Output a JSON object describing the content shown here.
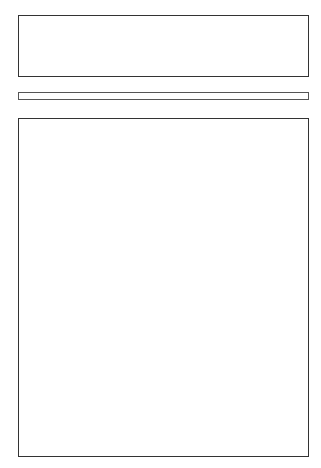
{
  "colors": {
    "frame": "#333333",
    "dark": "#8c8c8c",
    "mid": "#b0b0b0",
    "light": "#d4d4d4",
    "pale": "#e8e8e8",
    "white": "#ffffff"
  },
  "controls": {
    "up_arrow": "↑",
    "down_arrow": "↓"
  },
  "top_row": {
    "tiles": [
      {
        "band": "mid",
        "pattern": "grid",
        "cells": [
          "light",
          "pale",
          "pale",
          "light",
          "light",
          "pale"
        ]
      },
      {
        "band": "pale",
        "pattern": "f",
        "cells": [
          "white",
          "dark",
          "dark",
          "white",
          "white",
          "dark"
        ]
      },
      {
        "band": "mid",
        "pattern": "grid",
        "cells": [
          "pale",
          "pale",
          "pale",
          "pale",
          "pale",
          "pale"
        ]
      },
      {
        "band": "pale",
        "pattern": "f",
        "cells": [
          "dark",
          "white",
          "white",
          "dark",
          "dark",
          "white"
        ]
      },
      {
        "band": "mid",
        "pattern": "f",
        "cells": [
          "pale",
          "dark",
          "dark",
          "pale",
          "pale",
          "dark"
        ]
      }
    ]
  },
  "grid": {
    "rows": [
      {
        "tiles": [
          {
            "band": "pale",
            "pattern": "f",
            "cells": [
              "dark",
              "light",
              "light",
              "dark",
              "dark",
              "light"
            ]
          },
          {
            "band": "mid",
            "pattern": "grid",
            "cells": [
              "pale",
              "pale",
              "pale",
              "pale",
              "pale",
              "pale"
            ]
          },
          {
            "band": "pale",
            "pattern": "f",
            "cells": [
              "dark",
              "white",
              "white",
              "dark",
              "dark",
              "white"
            ]
          },
          {
            "band": "mid",
            "pattern": "f",
            "cells": [
              "pale",
              "mid",
              "mid",
              "pale",
              "pale",
              "mid"
            ]
          },
          {
            "band": "pale",
            "pattern": "grid",
            "cells": [
              "pale",
              "pale",
              "pale",
              "pale",
              "pale",
              "pale"
            ]
          }
        ]
      },
      {
        "tiles": [
          {
            "band": "light",
            "pattern": "grid",
            "cells": [
              "pale",
              "pale",
              "pale",
              "pale",
              "pale",
              "pale"
            ]
          },
          {
            "band": "light",
            "pattern": "grid",
            "cells": [
              "light",
              "mid",
              "mid",
              "light",
              "light",
              "mid"
            ]
          },
          {
            "band": "light",
            "pattern": "f",
            "cells": [
              "pale",
              "mid",
              "mid",
              "pale",
              "pale",
              "mid"
            ]
          },
          {
            "band": "pale",
            "pattern": "f",
            "cells": [
              "dark",
              "light",
              "light",
              "dark",
              "dark",
              "light"
            ]
          },
          {
            "band": "mid",
            "pattern": "f",
            "cells": [
              "mid",
              "pale",
              "pale",
              "mid",
              "mid",
              "pale"
            ]
          }
        ]
      },
      {
        "tiles": [
          {
            "band": "pale",
            "pattern": "f",
            "cells": [
              "pale",
              "mid",
              "mid",
              "white",
              "pale",
              "mid"
            ]
          },
          {
            "band": "pale",
            "pattern": "grid",
            "cells": [
              "mid",
              "mid",
              "light",
              "light",
              "mid",
              "mid"
            ]
          },
          {
            "band": "mid",
            "pattern": "f",
            "cells": [
              "dark",
              "white",
              "white",
              "dark",
              "dark",
              "white"
            ]
          },
          {
            "band": "pale",
            "pattern": "f",
            "cells": [
              "mid",
              "pale",
              "pale",
              "mid",
              "mid",
              "pale"
            ]
          },
          {
            "band": "light",
            "pattern": "f",
            "cells": [
              "white",
              "mid",
              "mid",
              "white",
              "white",
              "mid"
            ]
          }
        ]
      },
      {
        "tiles": [
          {
            "band": "mid",
            "pattern": "f",
            "cells": [
              "white",
              "mid",
              "mid",
              "white",
              "white",
              "mid"
            ]
          },
          {
            "band": "light",
            "pattern": "grid",
            "cells": [
              "pale",
              "pale",
              "pale",
              "pale",
              "pale",
              "pale"
            ]
          },
          {
            "band": "pale",
            "pattern": "f",
            "cells": [
              "dark",
              "light",
              "light",
              "dark",
              "dark",
              "light"
            ]
          },
          {
            "band": "mid",
            "pattern": "grid",
            "cells": [
              "pale",
              "pale",
              "pale",
              "pale",
              "pale",
              "pale"
            ]
          },
          {
            "band": "pale",
            "pattern": "f",
            "cells": [
              "mid",
              "white",
              "white",
              "mid",
              "mid",
              "white"
            ]
          }
        ]
      },
      {
        "tiles": [
          {
            "band": "pale",
            "pattern": "grid",
            "cells": [
              "light",
              "light",
              "light",
              "light",
              "light",
              "light"
            ]
          },
          {
            "band": "pale",
            "pattern": "f",
            "cells": [
              "white",
              "dark",
              "dark",
              "white",
              "white",
              "dark"
            ]
          },
          {
            "band": "pale",
            "pattern": "grid",
            "cells": [
              "pale",
              "light",
              "light",
              "pale",
              "pale",
              "light"
            ]
          },
          {
            "band": "pale",
            "pattern": "grid",
            "cells": [
              "pale",
              "pale",
              "pale",
              "pale",
              "pale",
              "pale"
            ]
          },
          {
            "band": "mid",
            "pattern": "grid",
            "cells": [
              "light",
              "pale",
              "pale",
              "light",
              "light",
              "pale"
            ]
          }
        ]
      }
    ]
  }
}
